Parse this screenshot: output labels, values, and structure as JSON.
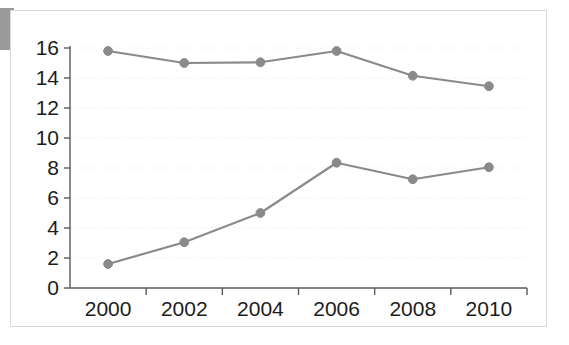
{
  "chart_data": {
    "type": "line",
    "title": "",
    "subtitle": "",
    "xlabel": "",
    "ylabel": "",
    "categories": [
      "2000",
      "2002",
      "2004",
      "2006",
      "2008",
      "2010"
    ],
    "x": [
      2000,
      2002,
      2004,
      2006,
      2008,
      2010
    ],
    "series": [
      {
        "name": "upper-series",
        "values": [
          15.8,
          15.0,
          15.05,
          15.8,
          14.15,
          13.45
        ],
        "color": "#8a8a8a",
        "marker": "circle"
      },
      {
        "name": "lower-series",
        "values": [
          1.6,
          3.05,
          5.0,
          8.35,
          7.25,
          8.05
        ],
        "color": "#8a8a8a",
        "marker": "circle"
      }
    ],
    "ylim": [
      0,
      16
    ],
    "yticks": [
      0,
      2,
      4,
      6,
      8,
      10,
      12,
      14,
      16
    ],
    "ytick_labels": [
      "0",
      "2",
      "4",
      "6",
      "8",
      "10",
      "12",
      "14",
      "16"
    ],
    "xtick_labels": [
      "2000",
      "2002",
      "2004",
      "2006",
      "2008",
      "2010"
    ],
    "grid": true,
    "grid_axis": "y",
    "grid_color": "#e9e9e9",
    "legend": false,
    "legend_position": "none",
    "axis_color": "#5a5a5a",
    "background": "#ffffff",
    "border_color": "#d8d8d8"
  },
  "decor": {
    "corner_tab_color": "#9a9a9a",
    "corner_tab_name": "page-corner-marker"
  }
}
